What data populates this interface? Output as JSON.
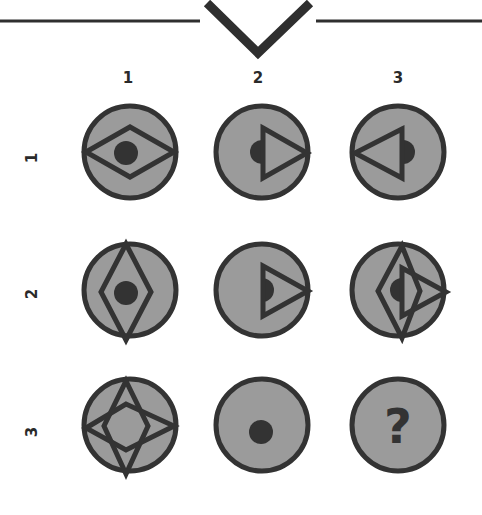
{
  "header": {
    "decoration": "v-notch-line",
    "line_color": "#2f2f2f"
  },
  "puzzle": {
    "column_labels": [
      "1",
      "2",
      "3"
    ],
    "row_labels": [
      "1",
      "2",
      "3"
    ],
    "colors": {
      "circle_fill": "#9b9b9b",
      "stroke": "#333333",
      "dot": "#333333"
    },
    "cells": [
      {
        "row": 1,
        "col": 1,
        "content": "horizontal diamond with center dot"
      },
      {
        "row": 1,
        "col": 2,
        "content": "right-pointing triangle with left half-dot outside"
      },
      {
        "row": 1,
        "col": 3,
        "content": "left-pointing triangle with right half-dot outside"
      },
      {
        "row": 2,
        "col": 1,
        "content": "vertical diamond with center dot"
      },
      {
        "row": 2,
        "col": 2,
        "content": "right-pointing triangle with right half-dot inside"
      },
      {
        "row": 2,
        "col": 3,
        "content": "vertical diamond overlaid with right-pointing triangle and half-dot"
      },
      {
        "row": 3,
        "col": 1,
        "content": "four-pointed star (horizontal + vertical diamonds)"
      },
      {
        "row": 3,
        "col": 2,
        "content": "center dot only"
      },
      {
        "row": 3,
        "col": 3,
        "content": "question mark"
      }
    ],
    "missing_symbol": "?"
  }
}
